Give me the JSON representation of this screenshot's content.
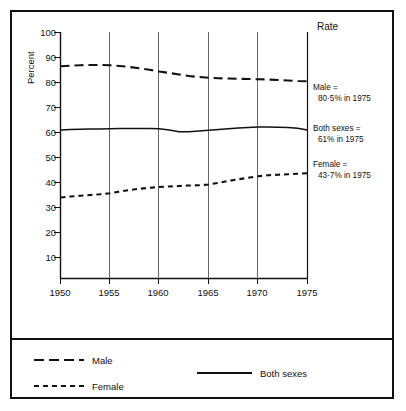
{
  "chart_data": {
    "type": "line",
    "title": "",
    "header_label": "Rate",
    "xlabel": "",
    "ylabel": "Percent",
    "xlim": [
      1950,
      1975
    ],
    "ylim": [
      0,
      100
    ],
    "grid": "vertical",
    "legend_position": "bottom",
    "xticks": [
      "1950",
      "1955",
      "1960",
      "1965",
      "1970",
      "1975"
    ],
    "yticks": [
      "10",
      "20",
      "30",
      "40",
      "50",
      "60",
      "70",
      "80",
      "90",
      "100"
    ],
    "x": [
      1950,
      1951,
      1952,
      1953,
      1954,
      1955,
      1956,
      1957,
      1958,
      1959,
      1960,
      1961,
      1962,
      1963,
      1964,
      1965,
      1966,
      1967,
      1968,
      1969,
      1970,
      1971,
      1972,
      1973,
      1974,
      1975
    ],
    "series": [
      {
        "name": "Male",
        "style": "long-dash",
        "values": [
          86.5,
          86.7,
          86.9,
          87.0,
          87.0,
          86.9,
          86.6,
          86.2,
          85.7,
          85.1,
          84.4,
          83.8,
          83.2,
          82.6,
          82.2,
          81.9,
          81.7,
          81.6,
          81.5,
          81.4,
          81.3,
          81.2,
          81.0,
          80.8,
          80.6,
          80.5
        ]
      },
      {
        "name": "Both sexes",
        "style": "solid",
        "values": [
          61.0,
          61.2,
          61.3,
          61.4,
          61.4,
          61.5,
          61.6,
          61.6,
          61.6,
          61.6,
          61.5,
          61.0,
          60.3,
          60.3,
          60.6,
          60.9,
          61.2,
          61.5,
          61.8,
          62.0,
          62.2,
          62.2,
          62.1,
          62.0,
          61.7,
          61.0
        ]
      },
      {
        "name": "Female",
        "style": "short-dash",
        "values": [
          34.0,
          34.4,
          34.7,
          35.0,
          35.3,
          35.7,
          36.4,
          37.0,
          37.5,
          37.9,
          38.2,
          38.4,
          38.6,
          38.8,
          38.9,
          39.2,
          39.9,
          40.6,
          41.3,
          41.9,
          42.5,
          42.9,
          43.1,
          43.3,
          43.5,
          43.7
        ]
      }
    ],
    "annotations": [
      {
        "id": "male",
        "line1": "Male =",
        "line2": "80·5% in 1975",
        "value": 80.5
      },
      {
        "id": "both",
        "line1": "Both sexes =",
        "line2": "61% in 1975",
        "value": 61.0
      },
      {
        "id": "female",
        "line1": "Female =",
        "line2": "43·7% in 1975",
        "value": 43.7
      }
    ],
    "legend": [
      {
        "name": "Male",
        "style": "long-dash"
      },
      {
        "name": "Female",
        "style": "short-dash"
      },
      {
        "name": "Both sexes",
        "style": "solid"
      }
    ],
    "colors": {
      "line": "#111111",
      "grid": "#555555",
      "axis": "#111111",
      "background": "#ffffff"
    }
  }
}
